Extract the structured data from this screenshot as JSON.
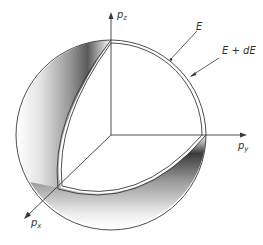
{
  "figure": {
    "type": "momentum-space spherical shell cutaway",
    "axes": {
      "z": {
        "label": "p",
        "subscript": "z"
      },
      "y": {
        "label": "p",
        "subscript": "y"
      },
      "x": {
        "label": "p",
        "subscript": "x"
      }
    },
    "annotations": {
      "inner_surface": "E",
      "outer_surface": "E + dE"
    },
    "colors": {
      "line": "#3a3a3a",
      "shade_dark": "#2e2e2e",
      "shade_light": "#ffffff",
      "background": "#ffffff"
    }
  }
}
